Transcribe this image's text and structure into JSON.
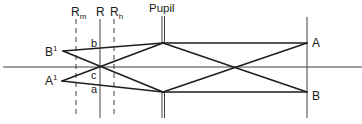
{
  "labels": {
    "retina_myopic": "R",
    "retina_myopic_sub": "m",
    "retina": "R",
    "retina_hyperopic": "R",
    "retina_hyperopic_sub": "h",
    "pupil": "Pupil",
    "object_top": "A",
    "object_bottom": "B",
    "image_top": "B",
    "image_top_sup": "1",
    "image_bottom": "A",
    "image_bottom_sup": "1",
    "point_b": "b",
    "point_c": "c",
    "point_a": "a"
  }
}
